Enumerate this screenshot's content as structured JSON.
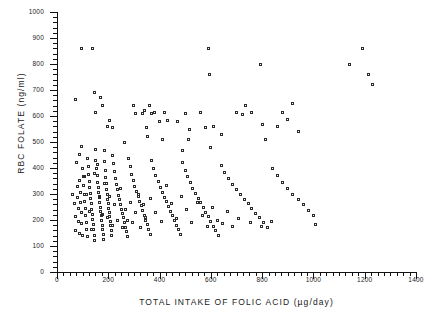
{
  "chart_data": {
    "type": "scatter",
    "title": "",
    "xlabel": "TOTAL  INTAKE  OF  FOLIC  ACID  (µg/day)",
    "ylabel": "RBC  FOLATE  (ng/ml)",
    "xlim": [
      0,
      1400
    ],
    "ylim": [
      0,
      1000
    ],
    "xticks": [
      0,
      200,
      400,
      600,
      800,
      1000,
      1200,
      1400
    ],
    "yticks": [
      0,
      100,
      200,
      300,
      400,
      500,
      600,
      700,
      800,
      900,
      1000
    ],
    "xtick_labels": [
      "0",
      "200",
      "400",
      "600",
      "800",
      "1000",
      "1200",
      "1400"
    ],
    "ytick_labels": [
      "0",
      "100",
      "200",
      "300",
      "400",
      "500",
      "600",
      "700",
      "800",
      "900",
      "1000"
    ],
    "x_minor_step": 25,
    "y_minor_step": 20,
    "grid": false,
    "legend": null,
    "marker": "open-square",
    "marker_color": "#2b2b2b",
    "n_points": 245,
    "points": [
      [
        72,
        665
      ],
      [
        95,
        860
      ],
      [
        140,
        858
      ],
      [
        148,
        690
      ],
      [
        150,
        612
      ],
      [
        168,
        672
      ],
      [
        176,
        640
      ],
      [
        196,
        560
      ],
      [
        206,
        582
      ],
      [
        218,
        556
      ],
      [
        262,
        500
      ],
      [
        300,
        640
      ],
      [
        306,
        608
      ],
      [
        332,
        610
      ],
      [
        340,
        620
      ],
      [
        348,
        556
      ],
      [
        352,
        520
      ],
      [
        360,
        640
      ],
      [
        368,
        610
      ],
      [
        380,
        612
      ],
      [
        398,
        578
      ],
      [
        412,
        508
      ],
      [
        420,
        612
      ],
      [
        432,
        582
      ],
      [
        470,
        580
      ],
      [
        488,
        468
      ],
      [
        500,
        610
      ],
      [
        512,
        508
      ],
      [
        516,
        550
      ],
      [
        560,
        612
      ],
      [
        580,
        556
      ],
      [
        590,
        860
      ],
      [
        596,
        758
      ],
      [
        600,
        480
      ],
      [
        610,
        560
      ],
      [
        640,
        530
      ],
      [
        700,
        612
      ],
      [
        722,
        606
      ],
      [
        736,
        640
      ],
      [
        760,
        612
      ],
      [
        792,
        800
      ],
      [
        800,
        566
      ],
      [
        812,
        508
      ],
      [
        860,
        560
      ],
      [
        880,
        612
      ],
      [
        900,
        586
      ],
      [
        920,
        650
      ],
      [
        940,
        540
      ],
      [
        1010,
        182
      ],
      [
        1140,
        800
      ],
      [
        1190,
        860
      ],
      [
        1215,
        760
      ],
      [
        1230,
        720
      ],
      [
        60,
        300
      ],
      [
        68,
        262
      ],
      [
        72,
        212
      ],
      [
        74,
        158
      ],
      [
        78,
        330
      ],
      [
        80,
        288
      ],
      [
        82,
        244
      ],
      [
        84,
        196
      ],
      [
        86,
        148
      ],
      [
        88,
        352
      ],
      [
        90,
        306
      ],
      [
        92,
        268
      ],
      [
        94,
        228
      ],
      [
        96,
        186
      ],
      [
        98,
        142
      ],
      [
        100,
        400
      ],
      [
        102,
        368
      ],
      [
        104,
        332
      ],
      [
        106,
        300
      ],
      [
        108,
        272
      ],
      [
        110,
        246
      ],
      [
        112,
        218
      ],
      [
        114,
        192
      ],
      [
        116,
        164
      ],
      [
        118,
        138
      ],
      [
        120,
        438
      ],
      [
        122,
        404
      ],
      [
        124,
        376
      ],
      [
        126,
        350
      ],
      [
        128,
        326
      ],
      [
        130,
        302
      ],
      [
        132,
        282
      ],
      [
        134,
        262
      ],
      [
        136,
        242
      ],
      [
        138,
        222
      ],
      [
        140,
        202
      ],
      [
        142,
        182
      ],
      [
        144,
        162
      ],
      [
        146,
        142
      ],
      [
        148,
        122
      ],
      [
        150,
        470
      ],
      [
        152,
        430
      ],
      [
        154,
        398
      ],
      [
        156,
        370
      ],
      [
        158,
        346
      ],
      [
        160,
        324
      ],
      [
        162,
        304
      ],
      [
        164,
        286
      ],
      [
        166,
        268
      ],
      [
        168,
        250
      ],
      [
        170,
        234
      ],
      [
        172,
        216
      ],
      [
        174,
        198
      ],
      [
        176,
        180
      ],
      [
        178,
        162
      ],
      [
        180,
        144
      ],
      [
        182,
        126
      ],
      [
        184,
        466
      ],
      [
        186,
        424
      ],
      [
        188,
        392
      ],
      [
        190,
        364
      ],
      [
        192,
        340
      ],
      [
        194,
        318
      ],
      [
        196,
        298
      ],
      [
        198,
        280
      ],
      [
        200,
        262
      ],
      [
        202,
        246
      ],
      [
        204,
        230
      ],
      [
        206,
        212
      ],
      [
        208,
        196
      ],
      [
        210,
        178
      ],
      [
        212,
        160
      ],
      [
        214,
        142
      ],
      [
        216,
        450
      ],
      [
        220,
        416
      ],
      [
        224,
        386
      ],
      [
        228,
        360
      ],
      [
        232,
        338
      ],
      [
        236,
        316
      ],
      [
        240,
        296
      ],
      [
        244,
        278
      ],
      [
        248,
        260
      ],
      [
        252,
        242
      ],
      [
        256,
        226
      ],
      [
        260,
        208
      ],
      [
        264,
        190
      ],
      [
        268,
        172
      ],
      [
        272,
        154
      ],
      [
        276,
        136
      ],
      [
        280,
        436
      ],
      [
        286,
        404
      ],
      [
        292,
        376
      ],
      [
        298,
        352
      ],
      [
        304,
        330
      ],
      [
        310,
        310
      ],
      [
        316,
        290
      ],
      [
        322,
        272
      ],
      [
        328,
        254
      ],
      [
        334,
        236
      ],
      [
        340,
        218
      ],
      [
        346,
        200
      ],
      [
        352,
        182
      ],
      [
        358,
        164
      ],
      [
        364,
        146
      ],
      [
        370,
        430
      ],
      [
        378,
        400
      ],
      [
        386,
        372
      ],
      [
        394,
        348
      ],
      [
        402,
        326
      ],
      [
        410,
        306
      ],
      [
        418,
        288
      ],
      [
        426,
        270
      ],
      [
        434,
        252
      ],
      [
        442,
        234
      ],
      [
        450,
        216
      ],
      [
        458,
        198
      ],
      [
        466,
        180
      ],
      [
        474,
        162
      ],
      [
        482,
        144
      ],
      [
        490,
        420
      ],
      [
        500,
        392
      ],
      [
        510,
        366
      ],
      [
        520,
        344
      ],
      [
        530,
        322
      ],
      [
        540,
        302
      ],
      [
        550,
        284
      ],
      [
        560,
        266
      ],
      [
        570,
        248
      ],
      [
        580,
        230
      ],
      [
        590,
        212
      ],
      [
        600,
        194
      ],
      [
        610,
        176
      ],
      [
        620,
        158
      ],
      [
        630,
        140
      ],
      [
        640,
        410
      ],
      [
        655,
        384
      ],
      [
        670,
        360
      ],
      [
        685,
        338
      ],
      [
        700,
        318
      ],
      [
        715,
        298
      ],
      [
        730,
        280
      ],
      [
        745,
        262
      ],
      [
        760,
        244
      ],
      [
        775,
        226
      ],
      [
        790,
        208
      ],
      [
        805,
        190
      ],
      [
        820,
        172
      ],
      [
        840,
        400
      ],
      [
        860,
        370
      ],
      [
        880,
        344
      ],
      [
        900,
        320
      ],
      [
        920,
        298
      ],
      [
        940,
        278
      ],
      [
        960,
        258
      ],
      [
        980,
        238
      ],
      [
        1000,
        218
      ],
      [
        76,
        420
      ],
      [
        86,
        452
      ],
      [
        96,
        484
      ],
      [
        106,
        368
      ],
      [
        116,
        300
      ],
      [
        126,
        232
      ],
      [
        136,
        164
      ],
      [
        146,
        380
      ],
      [
        156,
        412
      ],
      [
        166,
        290
      ],
      [
        176,
        220
      ],
      [
        186,
        340
      ],
      [
        196,
        210
      ],
      [
        206,
        290
      ],
      [
        216,
        180
      ],
      [
        226,
        260
      ],
      [
        236,
        200
      ],
      [
        246,
        320
      ],
      [
        256,
        170
      ],
      [
        266,
        240
      ],
      [
        276,
        200
      ],
      [
        286,
        268
      ],
      [
        296,
        190
      ],
      [
        306,
        230
      ],
      [
        316,
        300
      ],
      [
        326,
        170
      ],
      [
        336,
        258
      ],
      [
        346,
        210
      ],
      [
        366,
        282
      ],
      [
        386,
        230
      ],
      [
        406,
        196
      ],
      [
        426,
        332
      ],
      [
        446,
        262
      ],
      [
        466,
        206
      ],
      [
        486,
        290
      ],
      [
        506,
        240
      ],
      [
        526,
        190
      ],
      [
        546,
        268
      ],
      [
        566,
        218
      ],
      [
        586,
        176
      ],
      [
        606,
        250
      ],
      [
        626,
        200
      ],
      [
        646,
        186
      ],
      [
        666,
        232
      ],
      [
        686,
        176
      ],
      [
        706,
        206
      ],
      [
        756,
        190
      ],
      [
        796,
        176
      ],
      [
        836,
        196
      ]
    ]
  },
  "figure": {
    "marker_shape_label": "open-square-marker",
    "background": "#ffffff",
    "axis_color": "#111111"
  }
}
